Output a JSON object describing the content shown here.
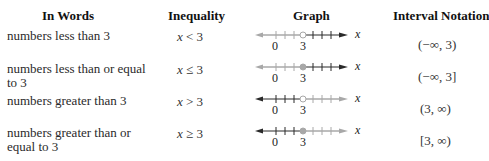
{
  "table": {
    "headers": [
      "In Words",
      "Inequality",
      "Graph",
      "Interval Notation"
    ],
    "rows": [
      {
        "words": "numbers less than 3",
        "inequality_var": "x",
        "inequality_rest": "< 3",
        "graph": {
          "shaded_side": "left",
          "endpoint": "open",
          "tick_labels": [
            "0",
            "3"
          ],
          "axis_label": "x"
        },
        "interval": "(−∞, 3)"
      },
      {
        "words": "numbers less than or equal to 3",
        "inequality_var": "x",
        "inequality_rest": "≤ 3",
        "graph": {
          "shaded_side": "left",
          "endpoint": "closed",
          "tick_labels": [
            "0",
            "3"
          ],
          "axis_label": "x"
        },
        "interval": "(−∞, 3]"
      },
      {
        "words": "numbers greater than 3",
        "inequality_var": "x",
        "inequality_rest": "> 3",
        "graph": {
          "shaded_side": "right",
          "endpoint": "open",
          "tick_labels": [
            "0",
            "3"
          ],
          "axis_label": "x"
        },
        "interval": "(3, ∞)"
      },
      {
        "words": "numbers greater than or equal to 3",
        "inequality_var": "x",
        "inequality_rest": "≥ 3",
        "graph": {
          "shaded_side": "right",
          "endpoint": "closed",
          "tick_labels": [
            "0",
            "3"
          ],
          "axis_label": "x"
        },
        "interval": "[3, ∞)"
      }
    ]
  },
  "colors": {
    "shaded": "#a8a8a8",
    "line": "#2a2a2a",
    "text": "#2a2a2a"
  }
}
